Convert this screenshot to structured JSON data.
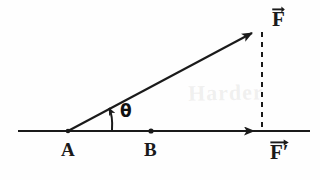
{
  "figure": {
    "type": "force-vector-diagram",
    "background_color": "#fefefe",
    "stroke_color": "#1a1a1a"
  },
  "labels": {
    "point_a": "A",
    "point_b": "B",
    "force_vector": "F",
    "force_component": "F′",
    "angle": "θ"
  },
  "watermark": {
    "text": "Harder",
    "visible": "true"
  },
  "geometry": {
    "baseline": {
      "x1": 18,
      "y1": 131,
      "x2": 310,
      "y2": 131
    },
    "point_a": {
      "x": 68,
      "y": 131
    },
    "point_b": {
      "x": 151,
      "y": 131
    },
    "force_vector": {
      "x1": 68,
      "y1": 131,
      "x2": 260,
      "y2": 28
    },
    "component_vector": {
      "x1": 68,
      "y1": 131,
      "x2": 262,
      "y2": 131
    },
    "dashed_drop": {
      "x1": 262,
      "y1": 32,
      "x2": 262,
      "y2": 128
    },
    "angle_arc_degrees": 28
  }
}
